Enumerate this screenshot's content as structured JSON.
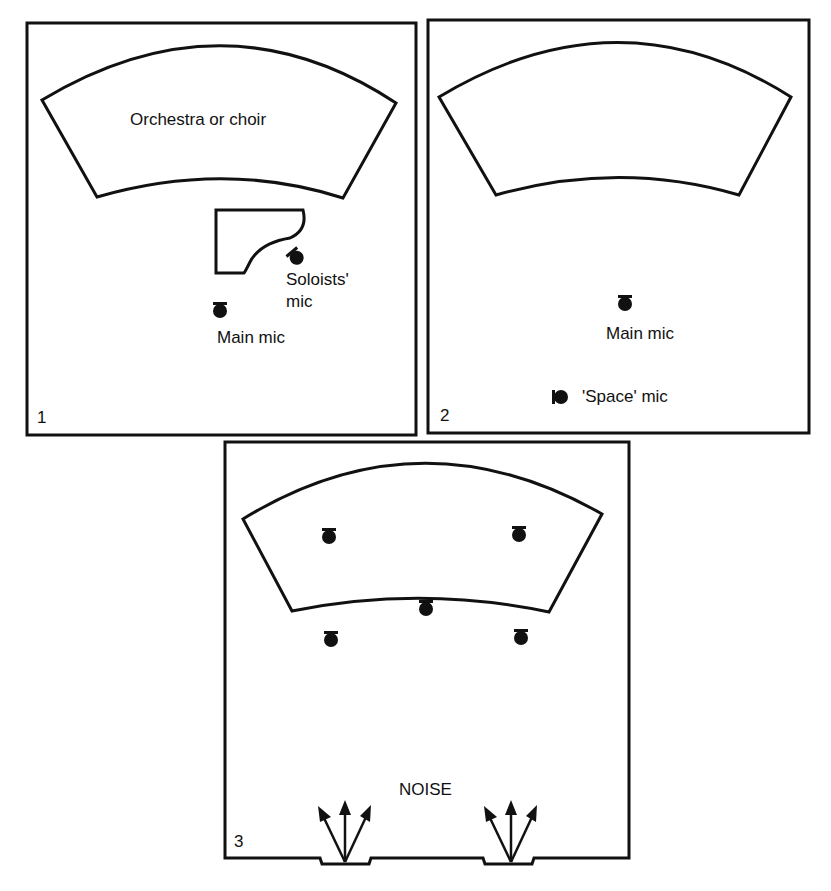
{
  "panels": [
    {
      "number": "1",
      "stage_label": "Orchestra or choir",
      "labels": {
        "soloists_mic_line1": "Soloists'",
        "soloists_mic_line2": "mic",
        "main_mic": "Main mic"
      }
    },
    {
      "number": "2",
      "stage_label": "",
      "labels": {
        "main_mic": "Main mic",
        "space_mic": "'Space' mic"
      }
    },
    {
      "number": "3",
      "labels": {
        "noise": "NOISE"
      },
      "mic_count": 5,
      "noise_sources": 2
    }
  ],
  "colors": {
    "ink": "#111111",
    "background": "#ffffff"
  }
}
